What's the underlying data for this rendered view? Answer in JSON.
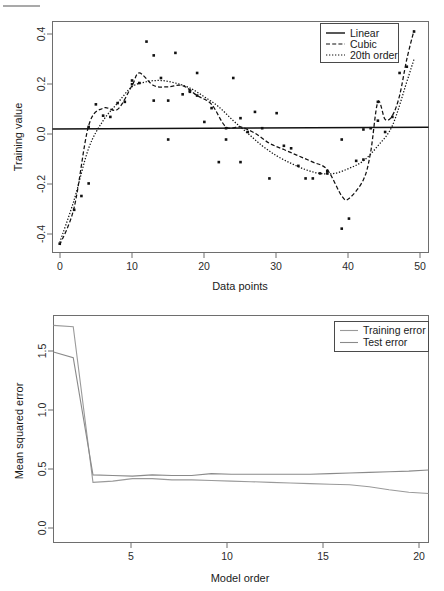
{
  "figure": {
    "artifact_rule_visible": true
  },
  "charts": [
    {
      "id": "training-value-plot",
      "xlabel": "Data points",
      "ylabel": "Training value",
      "xticks": [
        "0",
        "10",
        "20",
        "30",
        "40",
        "50"
      ],
      "yticks": [
        "0.4",
        "0.2",
        "0.0",
        "-0.2",
        "-0.4"
      ],
      "legend": [
        {
          "label": "Linear",
          "style": "solid"
        },
        {
          "label": "Cubic",
          "style": "dashed"
        },
        {
          "label": "20th order",
          "style": "dotted"
        }
      ]
    },
    {
      "id": "mse-vs-model-order-plot",
      "xlabel": "Model order",
      "ylabel": "Mean squared error",
      "xticks": [
        "5",
        "10",
        "15",
        "20"
      ],
      "yticks": [
        "0.0",
        "0.5",
        "1.0",
        "1.5"
      ],
      "legend": [
        {
          "label": "Training error",
          "style": "solid"
        },
        {
          "label": "Test error",
          "style": "solid"
        }
      ]
    }
  ],
  "chart_data": [
    {
      "type": "scatter",
      "title": "",
      "xlabel": "Data points",
      "ylabel": "Training value",
      "xlim": [
        0,
        52
      ],
      "ylim": [
        -0.47,
        0.45
      ],
      "grid": false,
      "legend_position": "top-right",
      "xticks": [
        0,
        10,
        20,
        30,
        40,
        50
      ],
      "yticks": [
        -0.4,
        -0.2,
        0.0,
        0.2,
        0.4
      ],
      "points": {
        "x": [
          1,
          3,
          4,
          5,
          5,
          6,
          7,
          8,
          9,
          10,
          11,
          11,
          12,
          13,
          14,
          14,
          15,
          16,
          16,
          17,
          18,
          19,
          19,
          20,
          20,
          21,
          22,
          23,
          24,
          24,
          25,
          26,
          26,
          27,
          28,
          29,
          30,
          31,
          32,
          33,
          34,
          35,
          36,
          37,
          38,
          38,
          40,
          40,
          41,
          42,
          43,
          43,
          44,
          45,
          45,
          46,
          47,
          48,
          49,
          50
        ],
        "y": [
          -0.435,
          -0.3,
          -0.245,
          0.03,
          -0.195,
          0.12,
          0.075,
          0.07,
          0.125,
          0.13,
          0.215,
          0.2,
          0.205,
          0.37,
          0.135,
          0.315,
          0.225,
          0.135,
          -0.02,
          0.325,
          0.16,
          0.175,
          0.17,
          0.245,
          0.155,
          0.05,
          0.105,
          -0.11,
          0.025,
          -0.02,
          0.225,
          -0.11,
          0.065,
          0.01,
          0.09,
          0.025,
          -0.175,
          0.085,
          -0.045,
          -0.055,
          -0.125,
          -0.175,
          -0.175,
          -0.155,
          -0.155,
          -0.145,
          -0.02,
          -0.375,
          -0.335,
          -0.105,
          -0.1,
          0.02,
          0.025,
          0.13,
          0.055,
          0.01,
          0.07,
          0.245,
          0.27,
          0.41
        ]
      },
      "series": [
        {
          "name": "Linear",
          "style": "solid",
          "x": [
            0,
            52
          ],
          "y": [
            0.022,
            0.029
          ]
        },
        {
          "name": "Cubic",
          "style": "dashed",
          "x": [
            1,
            3,
            5,
            7,
            9,
            11,
            12,
            14,
            16,
            18,
            20,
            22,
            24,
            26,
            28,
            30,
            32,
            34,
            36,
            38,
            40,
            41,
            43,
            44,
            45,
            46,
            47,
            48,
            49,
            50
          ],
          "y": [
            -0.44,
            -0.29,
            0.035,
            0.105,
            0.1,
            0.195,
            0.245,
            0.195,
            0.19,
            0.195,
            0.155,
            0.12,
            0.03,
            0.03,
            0.005,
            -0.035,
            -0.06,
            -0.085,
            -0.11,
            -0.14,
            -0.245,
            -0.255,
            -0.18,
            -0.07,
            0.13,
            0.06,
            0.075,
            0.155,
            0.3,
            0.415
          ]
        },
        {
          "name": "20th order",
          "style": "dotted",
          "x": [
            1,
            3,
            5,
            7,
            9,
            11,
            13,
            15,
            17,
            19,
            21,
            23,
            25,
            27,
            29,
            31,
            33,
            35,
            37,
            39,
            41,
            43,
            45,
            47,
            49,
            50
          ],
          "y": [
            -0.43,
            -0.26,
            -0.055,
            0.055,
            0.125,
            0.19,
            0.21,
            0.215,
            0.205,
            0.185,
            0.15,
            0.11,
            0.055,
            0.005,
            -0.045,
            -0.085,
            -0.115,
            -0.14,
            -0.155,
            -0.155,
            -0.135,
            -0.105,
            -0.045,
            0.035,
            0.21,
            0.3
          ]
        }
      ]
    },
    {
      "type": "line",
      "title": "",
      "xlabel": "Model order",
      "ylabel": "Mean squared error",
      "xlim": [
        1,
        20
      ],
      "ylim": [
        -0.05,
        1.78
      ],
      "grid": false,
      "legend_position": "top-right",
      "xticks": [
        5,
        10,
        15,
        20
      ],
      "yticks": [
        0.0,
        0.5,
        1.0,
        1.5
      ],
      "x": [
        1,
        2,
        3,
        4,
        5,
        6,
        7,
        8,
        9,
        10,
        11,
        12,
        13,
        14,
        15,
        16,
        17,
        18,
        19,
        20
      ],
      "series": [
        {
          "name": "Training error",
          "values": [
            1.7,
            1.69,
            0.435,
            0.445,
            0.465,
            0.465,
            0.455,
            0.455,
            0.45,
            0.445,
            0.44,
            0.435,
            0.43,
            0.425,
            0.42,
            0.415,
            0.4,
            0.375,
            0.355,
            0.345
          ]
        },
        {
          "name": "Test error",
          "values": [
            1.485,
            1.44,
            0.495,
            0.49,
            0.485,
            0.495,
            0.49,
            0.49,
            0.505,
            0.5,
            0.5,
            0.5,
            0.5,
            0.5,
            0.505,
            0.51,
            0.515,
            0.52,
            0.525,
            0.535
          ]
        }
      ]
    }
  ]
}
